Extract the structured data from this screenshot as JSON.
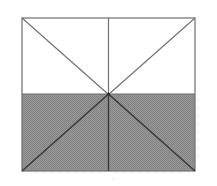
{
  "diagram": {
    "type": "rectangle-divided-into-triangles",
    "rect": {
      "x": 22,
      "y": 18,
      "width": 173,
      "height": 153
    },
    "center": {
      "x": 108,
      "y": 94
    },
    "shaded_region": "bottom-half",
    "colors": {
      "stroke": "#6e6e6e",
      "fill_shaded": "#8f8f8f",
      "fill_unshaded": "#ffffff",
      "background": "#ffffff"
    },
    "caption": "–"
  }
}
